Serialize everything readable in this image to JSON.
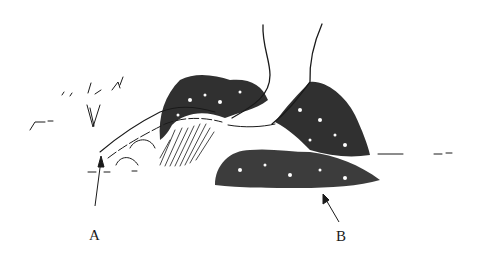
{
  "figure": {
    "labels": [
      {
        "id": "A",
        "text": "A",
        "points_to": "ground near fallen branch on left"
      },
      {
        "id": "B",
        "text": "B",
        "points_to": "ground beneath vegetation at right"
      }
    ],
    "ink_color": "#1a1a1a",
    "background_color": "#ffffff"
  }
}
